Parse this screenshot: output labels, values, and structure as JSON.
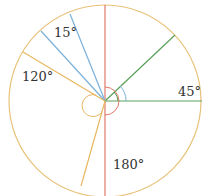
{
  "diagram": {
    "center": [
      105,
      101
    ],
    "radius": 97,
    "colors": {
      "circle": "#e8c27a",
      "red": "#e07a6a",
      "green": "#5aa05a",
      "blue": "#7ab0d8",
      "orange": "#e8b860"
    },
    "labels": {
      "a15": "15°",
      "a120": "120°",
      "a45": "45°",
      "a180": "180°"
    }
  }
}
